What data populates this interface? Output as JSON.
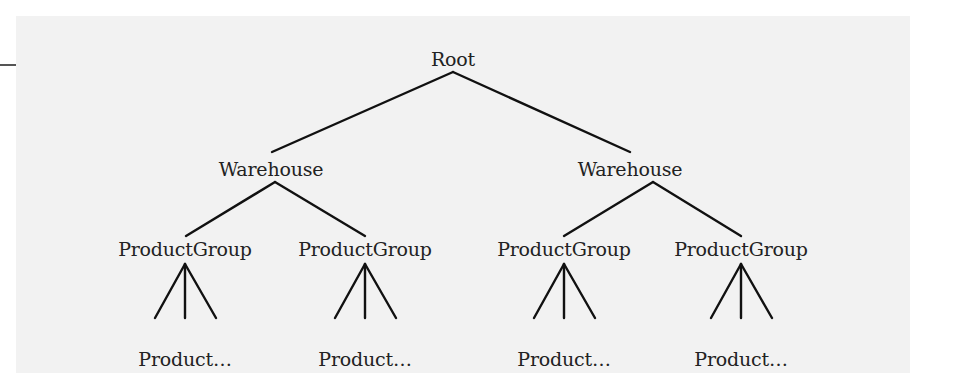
{
  "diagram": {
    "type": "tree",
    "line_color": "#111111",
    "background_color": "#f2f2f2",
    "root": {
      "label": "Root",
      "children": [
        {
          "label": "Warehouse",
          "children": [
            {
              "label": "ProductGroup",
              "children": [
                {
                  "label": "Product…"
                }
              ]
            },
            {
              "label": "ProductGroup",
              "children": [
                {
                  "label": "Product…"
                }
              ]
            }
          ]
        },
        {
          "label": "Warehouse",
          "children": [
            {
              "label": "ProductGroup",
              "children": [
                {
                  "label": "Product…"
                }
              ]
            },
            {
              "label": "ProductGroup",
              "children": [
                {
                  "label": "Product…"
                }
              ]
            }
          ]
        }
      ]
    }
  },
  "labels": {
    "root": "Root",
    "warehouse_left": "Warehouse",
    "warehouse_right": "Warehouse",
    "group_1": "ProductGroup",
    "group_2": "ProductGroup",
    "group_3": "ProductGroup",
    "group_4": "ProductGroup",
    "product_1": "Product…",
    "product_2": "Product…",
    "product_3": "Product…",
    "product_4": "Product…"
  }
}
